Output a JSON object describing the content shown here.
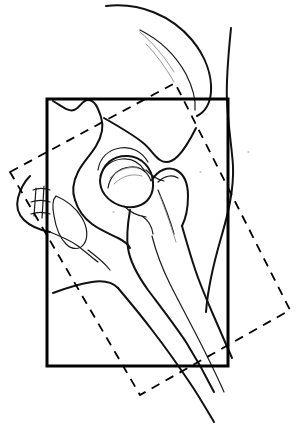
{
  "figure": {
    "type": "line-drawing",
    "canvas": {
      "width": 301,
      "height": 424,
      "background": "#ffffff"
    },
    "stroke_colors": {
      "outline_heavy": "#111111",
      "outline_light": "#1a1a1a",
      "faint": "#8a8a8a",
      "box_solid": "#000000",
      "box_dashed": "#000000"
    },
    "stroke_widths": {
      "bone_outline": 2.0,
      "bone_detail": 1.2,
      "faint_detail": 0.9,
      "box_solid": 3.0,
      "box_dashed": 1.8
    }
  },
  "solid_box": {
    "label": "aligned-roi-box",
    "style": "solid",
    "x": 47,
    "y": 99,
    "width": 181,
    "height": 267,
    "corners": [
      [
        47,
        99
      ],
      [
        228,
        99
      ],
      [
        228,
        366
      ],
      [
        47,
        366
      ]
    ]
  },
  "dashed_box": {
    "label": "rotated-roi-box",
    "style": "dashed",
    "dash_pattern": "9 7",
    "corners": [
      [
        10,
        172
      ],
      [
        175,
        83
      ],
      [
        290,
        310
      ],
      [
        140,
        395
      ]
    ],
    "rotation_note": "rotated rectangle overlaying the aligned box"
  },
  "anatomy": {
    "structures": [
      {
        "name": "iliac-crest",
        "description": "long superior curve sweeping from upper left to the right, apex near top of frame"
      },
      {
        "name": "ilium-body",
        "description": "broad wing descending from crest into the acetabular region"
      },
      {
        "name": "sacrum-edge",
        "description": "small segmented block at far left margin"
      },
      {
        "name": "acetabulum",
        "description": "cup-shaped arc above the femoral head"
      },
      {
        "name": "femoral-head",
        "description": "rounded ball seated in the acetabulum"
      },
      {
        "name": "femoral-neck",
        "description": "short angled column connecting head to trochanter"
      },
      {
        "name": "greater-trochanter",
        "description": "lateral bony prominence to the right of the neck"
      },
      {
        "name": "lesser-trochanter",
        "description": "small medial prominence below the neck"
      },
      {
        "name": "femoral-shaft",
        "description": "long tapering diaphysis running to lower right, exiting the frame"
      },
      {
        "name": "ischium",
        "description": "lower pelvic ring segment beneath the acetabulum"
      },
      {
        "name": "soft-tissue-outline",
        "description": "outer body contour on the right side of the frame"
      }
    ],
    "paths": {
      "iliac_crest_outer": "M 106 6 C 140 2 172 16 192 40 C 206 57 212 76 211 92 C 210 104 205 112 197 116",
      "iliac_crest_inner": "M 140 30 C 160 40 176 56 186 74 C 193 88 196 100 195 110",
      "body_contour_right": "M 231 28 C 228 58 226 82 227 100 C 228 126 232 148 233 166 C 234 190 228 214 221 238 C 214 262 208 286 206 312",
      "ilium_upper": "M 53 101 C 62 106 68 112 74 110 C 80 108 82 100 88 100 C 95 100 98 108 101 117 C 104 126 102 136 96 146 C 90 156 83 162 78 172 C 73 182 72 192 75 200",
      "ilium_lower": "M 75 200 C 78 210 84 218 92 224 C 100 230 110 234 118 238 C 124 241 128 244 130 248",
      "pelvic_brim": "M 104 118 C 118 126 132 134 142 142 C 150 148 154 156 160 160 C 166 164 172 162 178 156 C 184 150 190 140 196 128",
      "sacrum_block_outer": "M 30 176 C 24 182 20 190 18 198 C 16 206 18 214 24 220 C 30 226 40 230 50 232",
      "sacrum_block_inner_a": "M 33 190 C 38 188 44 188 50 190",
      "sacrum_block_inner_b": "M 31 202 C 37 200 44 200 50 202",
      "sacrum_block_inner_c": "M 31 214 C 37 212 44 212 50 214",
      "sacrum_seg_line_1": "M 36 188 L 34 216",
      "sacrum_seg_line_2": "M 44 186 L 42 218",
      "pubic_ramus": "M 50 232 C 60 236 70 240 78 246 C 86 252 92 258 98 262",
      "obturator_ring": "M 56 196 C 66 200 76 208 82 218 C 88 228 88 238 84 244 C 80 250 72 250 66 244 C 60 238 56 228 54 216 C 52 206 52 200 56 196",
      "acetabulum_arc": "M 98 170 C 100 158 108 150 120 148 C 132 146 142 152 148 162",
      "acetabulum_inner": "M 100 176 C 104 166 112 160 122 159 C 132 158 140 163 145 171",
      "femoral_head": "M 100 180 C 102 164 114 155 128 156 C 142 157 152 168 153 182 C 154 194 148 203 138 206 C 126 210 112 204 105 195 C 101 190 100 185 100 180",
      "femoral_head_shade": "M 108 188 C 110 176 118 168 130 167 C 140 166 148 172 151 181",
      "femoral_neck_upper": "M 146 170 C 152 176 158 180 164 181",
      "femoral_neck_lower": "M 124 206 C 130 212 138 216 146 217",
      "greater_trochanter": "M 152 180 C 158 170 168 166 176 170 C 184 174 188 184 188 196 C 188 208 186 218 182 226",
      "trochanter_inner": "M 158 182 C 164 176 172 174 178 178",
      "lesser_troch": "M 142 216 C 148 220 152 226 153 234",
      "femur_medial": "M 130 210 C 128 222 126 236 128 248 C 130 262 138 276 148 290 C 160 306 174 324 186 342 C 196 358 206 376 214 392",
      "femur_lateral": "M 182 226 C 186 240 190 254 194 266 C 199 282 206 298 212 312 C 219 328 226 344 232 358",
      "femur_shaft_mid": "M 152 236 C 156 252 162 268 170 284 C 180 304 192 326 202 346 C 210 362 218 378 224 392",
      "femur_inner_line": "M 158 190 C 164 204 170 220 174 234",
      "subtroch_line": "M 53 293 C 66 288 80 284 92 282 C 104 280 112 282 118 288",
      "thigh_outline_left": "M 118 288 C 128 300 140 314 152 330 C 166 348 180 368 192 386 C 200 398 208 412 214 422",
      "ischial_detail": "M 88 250 C 96 256 104 262 110 270"
    },
    "faint_paths": {
      "crest_hatch_1": "M 140 32 C 152 42 164 56 174 72",
      "crest_hatch_2": "M 146 44 C 156 54 166 68 174 82",
      "acet_hatch": "M 110 178 C 118 170 128 166 138 168",
      "head_hatch": "M 114 184 C 122 176 132 173 142 176",
      "shaft_hatch": "M 160 196 C 166 212 172 228 176 242",
      "dot_a": "M 248 152 l 1 0",
      "dot_b": "M 200 172 l 1 0",
      "dot_c": "M 113 212 l 1 0"
    }
  }
}
